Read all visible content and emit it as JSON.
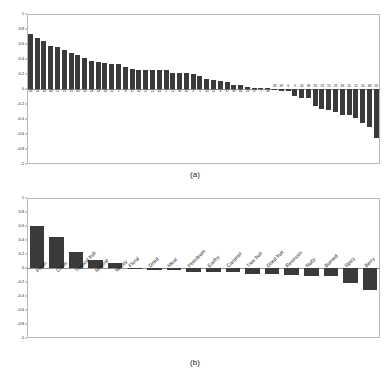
{
  "figure": {
    "panels": [
      {
        "caption": "(a)"
      },
      {
        "caption": "(b)"
      }
    ]
  },
  "axis": {
    "yticks": [
      "1",
      "0.8",
      "0.6",
      "0.4",
      "0.2",
      "0",
      "-0.2",
      "-0.4",
      "-0.6",
      "-0.8",
      "-1"
    ],
    "ymin": -1,
    "ymax": 1
  },
  "style": {
    "bar_color": "#3a3a3a",
    "axis_color": "#8d8d8d",
    "frame_color": "#b9b9b9",
    "background": "#ffffff"
  },
  "chart_data": [
    {
      "type": "bar",
      "title": "",
      "panel": "(a)",
      "xlabel": "",
      "ylabel": "",
      "ylim": [
        -1,
        1
      ],
      "grid": false,
      "legend": "none",
      "yticks": [
        "1",
        "0.8",
        "0.6",
        "0.4",
        "0.2",
        "0",
        "-0.2",
        "-0.4",
        "-0.6",
        "-0.8",
        "-1"
      ],
      "note": "Sample loadings sorted descending; category labels are sample numbers placed below the axis for positive bars and above the axis for negative bars.",
      "categories": [
        "34",
        "14",
        "33",
        "46",
        "21",
        "19",
        "25",
        "45",
        "50",
        "28",
        "24",
        "16",
        "51",
        "1",
        "8",
        "37",
        "42",
        "27",
        "22",
        "44",
        "2",
        "12",
        "30",
        "35",
        "3",
        "5",
        "53",
        "11",
        "4",
        "47",
        "39",
        "40",
        "26",
        "37",
        "7",
        "38",
        "18",
        "49",
        "6",
        "9",
        "41",
        "36",
        "31",
        "23",
        "15",
        "29",
        "43",
        "10",
        "52",
        "20",
        "48",
        "32"
      ],
      "values": [
        0.73,
        0.68,
        0.64,
        0.57,
        0.56,
        0.52,
        0.48,
        0.45,
        0.41,
        0.37,
        0.36,
        0.35,
        0.34,
        0.34,
        0.3,
        0.27,
        0.26,
        0.26,
        0.26,
        0.26,
        0.25,
        0.22,
        0.21,
        0.21,
        0.2,
        0.18,
        0.14,
        0.12,
        0.11,
        0.1,
        0.06,
        0.05,
        0.03,
        0.02,
        0.01,
        0.01,
        -0.01,
        -0.02,
        -0.03,
        -0.09,
        -0.12,
        -0.12,
        -0.23,
        -0.27,
        -0.28,
        -0.3,
        -0.35,
        -0.35,
        -0.38,
        -0.45,
        -0.5,
        -0.65
      ]
    },
    {
      "type": "bar",
      "title": "",
      "panel": "(b)",
      "xlabel": "",
      "ylabel": "",
      "ylim": [
        -1,
        1
      ],
      "grid": false,
      "legend": "none",
      "yticks": [
        "1",
        "0.8",
        "0.6",
        "0.4",
        "0.2",
        "0",
        "-0.2",
        "-0.4",
        "-0.6",
        "-0.8",
        "-1"
      ],
      "note": "Aroma descriptor loadings sorted descending; labels rotated 45 degrees, positive labels below the axis and negative labels above the axis.",
      "categories": [
        "Fresh",
        "Citrus",
        "Tropical fruit",
        "Mineral",
        "Yeasty",
        "Floral",
        "Dried",
        "Meat",
        "Petroleum",
        "Earthy",
        "Caramel",
        "Tree fruit",
        "Dried fruit",
        "Resinous",
        "Nutty",
        "Burned",
        "Spicy",
        "Berry"
      ],
      "values": [
        0.6,
        0.44,
        0.23,
        0.12,
        0.07,
        -0.01,
        -0.03,
        -0.03,
        -0.05,
        -0.05,
        -0.06,
        -0.08,
        -0.09,
        -0.1,
        -0.11,
        -0.12,
        -0.22,
        -0.32
      ]
    }
  ]
}
